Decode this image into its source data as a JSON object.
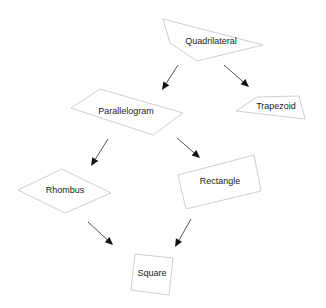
{
  "diagram": {
    "type": "hierarchy",
    "title": "",
    "colors": {
      "background": "#ffffff",
      "shape_stroke": "#cfcfcf",
      "text": "#222222",
      "arrow": "#555555",
      "arrowhead": "#111111"
    },
    "nodes": [
      {
        "id": "quadrilateral",
        "label": "Quadrilateral",
        "points": "163,19 263,45 197,61 170,43",
        "cx": 211,
        "cy": 42
      },
      {
        "id": "parallelogram",
        "label": "Parallelogram",
        "points": "71,108 100,89 183,113 153,135",
        "cx": 126,
        "cy": 112
      },
      {
        "id": "trapezoid",
        "label": "Trapezoid",
        "points": "236,111 257,97 299,96 305,119",
        "cx": 276,
        "cy": 107
      },
      {
        "id": "rhombus",
        "label": "Rhombus",
        "points": "18,190 62,169 111,193 65,213",
        "cx": 65,
        "cy": 191
      },
      {
        "id": "rectangle",
        "label": "Rectangle",
        "points": "178,175 254,155 261,191 186,209",
        "cx": 220,
        "cy": 182
      },
      {
        "id": "square",
        "label": "Square",
        "points": "135,254 173,258 169,295 131,290",
        "cx": 152,
        "cy": 274
      }
    ],
    "edges": [
      {
        "from": "quadrilateral",
        "to": "parallelogram",
        "x1": 178,
        "y1": 65,
        "x2": 162,
        "y2": 90
      },
      {
        "from": "quadrilateral",
        "to": "trapezoid",
        "x1": 224,
        "y1": 65,
        "x2": 249,
        "y2": 87
      },
      {
        "from": "parallelogram",
        "to": "rhombus",
        "x1": 108,
        "y1": 139,
        "x2": 91,
        "y2": 166
      },
      {
        "from": "parallelogram",
        "to": "rectangle",
        "x1": 177,
        "y1": 138,
        "x2": 200,
        "y2": 158
      },
      {
        "from": "rhombus",
        "to": "square",
        "x1": 88,
        "y1": 222,
        "x2": 113,
        "y2": 245
      },
      {
        "from": "rectangle",
        "to": "square",
        "x1": 191,
        "y1": 219,
        "x2": 175,
        "y2": 247
      }
    ]
  }
}
